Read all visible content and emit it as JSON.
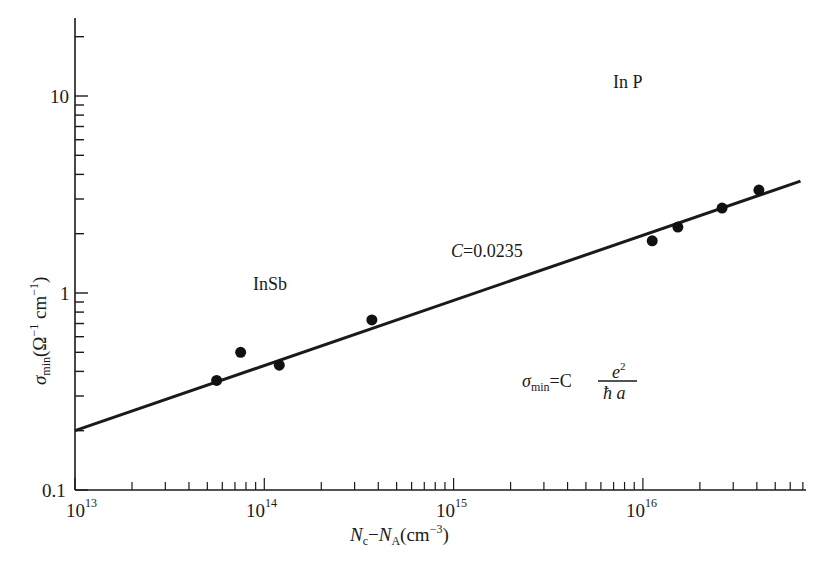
{
  "chart_data": {
    "type": "scatter",
    "title": "",
    "xlabel": "N_c − N_A (cm^-3)",
    "ylabel": "σ_min (Ω^-1 cm^-1)",
    "xscale": "log",
    "yscale": "log",
    "xlim": [
      10000000000000.0,
      7e+16
    ],
    "ylim": [
      0.1,
      25
    ],
    "x_ticks": [
      "10^13",
      "10^14",
      "10^15",
      "10^16"
    ],
    "y_ticks": [
      "0.1",
      "1",
      "10"
    ],
    "grid": false,
    "series": [
      {
        "name": "measured",
        "marker": "filled-circle",
        "x": [
          56000000000000.0,
          75000000000000.0,
          120000000000000.0,
          370000000000000.0,
          1.12e+16,
          1.53e+16,
          2.62e+16,
          4.1e+16
        ],
        "y": [
          0.36,
          0.5,
          0.43,
          0.73,
          1.84,
          2.16,
          2.7,
          3.33
        ]
      },
      {
        "name": "fit",
        "type": "line",
        "x": [
          10000000000000.0,
          6.8e+16
        ],
        "y": [
          0.2,
          3.7
        ]
      }
    ],
    "annotations": [
      {
        "text": "In P",
        "x": 3.5e+16,
        "y": 10
      },
      {
        "text": "InSb",
        "x": 120000000000000.0,
        "y": 1.0
      },
      {
        "text": "C=0.0235",
        "x": 2300000000000000.0,
        "y": 1.6
      },
      {
        "text": "σ_min = C e²/(ħ a)",
        "x": 5000000000000000.0,
        "y": 0.36
      }
    ]
  },
  "labels": {
    "y_tick_10": "10",
    "y_tick_1": "1",
    "y_tick_01": "0.1",
    "x_tick_13": "13",
    "x_tick_14": "14",
    "x_tick_15": "15",
    "x_tick_16": "16",
    "x_tick_base": "10",
    "xlabel_N1": "N",
    "xlabel_sub1": "c",
    "xlabel_minus": "−",
    "xlabel_N2": "N",
    "xlabel_sub2": "A",
    "xlabel_unit": "(cm",
    "xlabel_exp": "−3",
    "xlabel_close": ")",
    "ylabel_sigma": "σ",
    "ylabel_sub": "min",
    "ylabel_unit": "(Ω",
    "ylabel_exp1": "−1",
    "ylabel_cm": " cm",
    "ylabel_exp2": "−1",
    "ylabel_close": ")",
    "annot_inp": "In P",
    "annot_insb": "InSb",
    "annot_c": "C=0.0235",
    "formula_sigma": "σ",
    "formula_sub": "min",
    "formula_eq": "=C",
    "formula_num": "e",
    "formula_num_exp": "2",
    "formula_den": "ħ a"
  }
}
